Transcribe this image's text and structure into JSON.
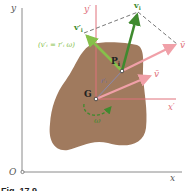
{
  "figure": {
    "caption": "Fig. 17.9",
    "colors": {
      "body": "#a07a5e",
      "axis": "#8a8a8a",
      "frame_axis": "#e0707a",
      "vbar": "#f0a0a8",
      "green_dark": "#3f8a2e",
      "green_light": "#86c04a",
      "dashed": "#555555",
      "text": "#333333"
    }
  },
  "axes": {
    "origin_label": "O",
    "x_label": "x",
    "y_label": "y"
  },
  "moving_frame": {
    "x_label": "x′",
    "y_label": "y′"
  },
  "points": {
    "center_of_mass": "G",
    "particle": "P",
    "particle_sub": "i"
  },
  "vectors": {
    "v_i": "v",
    "v_i_sub": "i",
    "v_prime_i": "v′",
    "v_prime_i_sub": "i",
    "v_prime_eq": "(v′ᵢ = r′ᵢ ω)",
    "r_prime_i": "r′ᵢ",
    "v_bar_top": "v̄",
    "v_bar_mid": "v̄",
    "omega": "ω"
  }
}
